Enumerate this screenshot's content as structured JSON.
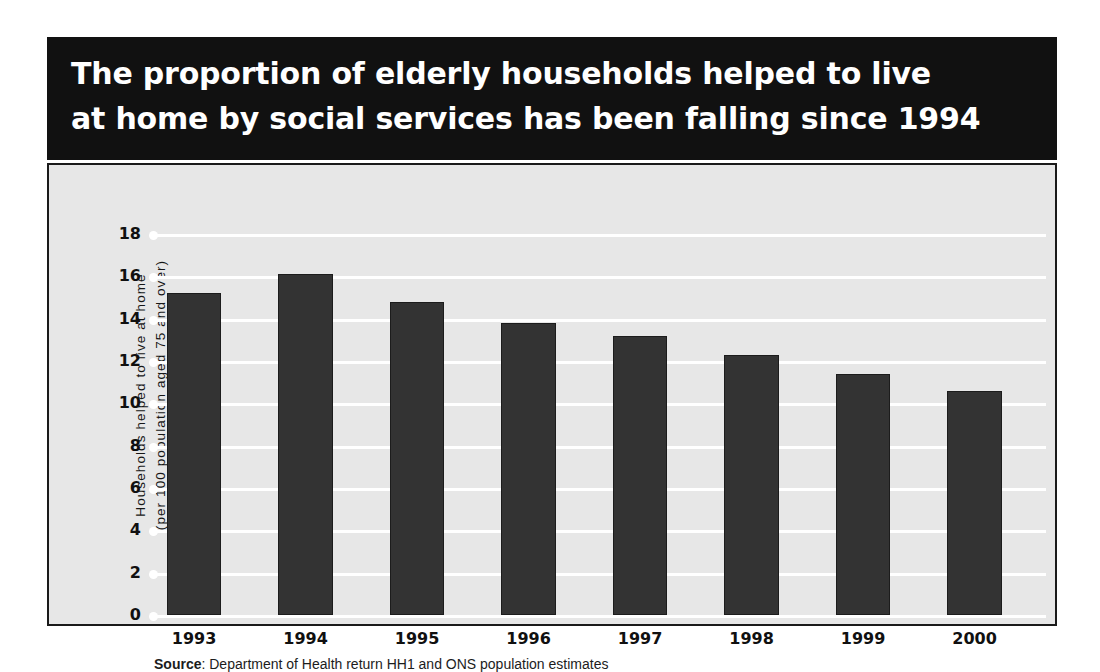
{
  "banner": {
    "title_line1": "The proportion of elderly households helped to live",
    "title_line2": "at home by social services has been falling since 1994",
    "background_color": "#111111",
    "text_color": "#ffffff"
  },
  "source": {
    "label": "Source",
    "separator": ":",
    "text": "Department of Health return HH1 and ONS population estimates"
  },
  "chart_data": {
    "type": "bar",
    "title": "The proportion of elderly households helped to live at home by social services has been falling since 1994",
    "categories": [
      "1993",
      "1994",
      "1995",
      "1996",
      "1997",
      "1998",
      "1999",
      "2000"
    ],
    "values": [
      15.2,
      16.1,
      14.8,
      13.8,
      13.2,
      12.3,
      11.4,
      10.6
    ],
    "xlabel": "",
    "ylabel_line1": "Households helped to live at home",
    "ylabel_line2": "(per 100 population aged 75 and over)",
    "ylim": [
      0,
      18
    ],
    "ytick_values": [
      18,
      16,
      14,
      12,
      10,
      8,
      6,
      4,
      2,
      0
    ],
    "ytick_labels": [
      "18",
      "16",
      "14",
      "12",
      "10",
      "8",
      "6",
      "4",
      "2",
      "0"
    ],
    "grid": true,
    "grid_color": "#ffffff",
    "legend": false,
    "bar_color": "#333333",
    "plot_background": "#e7e7e7"
  }
}
